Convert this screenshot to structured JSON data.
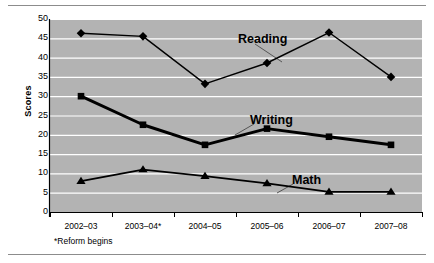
{
  "figure": {
    "axis_title": "Scores",
    "footnote": "*Reform begins"
  },
  "chart_data": {
    "type": "line",
    "title": "",
    "xlabel": "",
    "ylabel": "Scores",
    "categories": [
      "2002–03",
      "2003–04*",
      "2004–05",
      "2005–06",
      "2006–07",
      "2007–08"
    ],
    "ylim": [
      0,
      50
    ],
    "ytick_values": [
      0,
      5,
      10,
      15,
      20,
      25,
      30,
      35,
      40,
      45,
      50
    ],
    "ytick_labels": [
      "0",
      "5",
      "10",
      "15",
      "20",
      "25",
      "30",
      "35",
      "40",
      "45",
      "50"
    ],
    "grid": true,
    "grid_color": "#ffffff",
    "plot_background": "#b3b3b3",
    "legend": "inline-annotations",
    "series": [
      {
        "name": "Reading",
        "marker": "diamond",
        "color": "#000000",
        "line_width": 1.4,
        "values": [
          46.3,
          45.5,
          33.2,
          38.6,
          46.5,
          35.0
        ],
        "label_x": 238,
        "label_y": 32
      },
      {
        "name": "Writing",
        "marker": "square",
        "color": "#000000",
        "line_width": 3.0,
        "values": [
          30.0,
          22.6,
          17.4,
          21.6,
          19.5,
          17.4
        ],
        "label_x": 250,
        "label_y": 113
      },
      {
        "name": "Math",
        "marker": "triangle",
        "color": "#000000",
        "line_width": 1.8,
        "values": [
          8.0,
          11.0,
          9.3,
          7.4,
          5.2,
          5.2
        ],
        "label_x": 292,
        "label_y": 173
      }
    ],
    "annotations": [
      {
        "text": "Reading",
        "leader_from": [
          255,
          44
        ],
        "leader_to": [
          282,
          62
        ]
      },
      {
        "text": "Writing",
        "leader_from": [
          254,
          124
        ],
        "leader_to": [
          235,
          135
        ]
      },
      {
        "text": "Math",
        "leader_from": [
          293,
          184
        ],
        "leader_to": [
          277,
          193
        ]
      }
    ]
  }
}
